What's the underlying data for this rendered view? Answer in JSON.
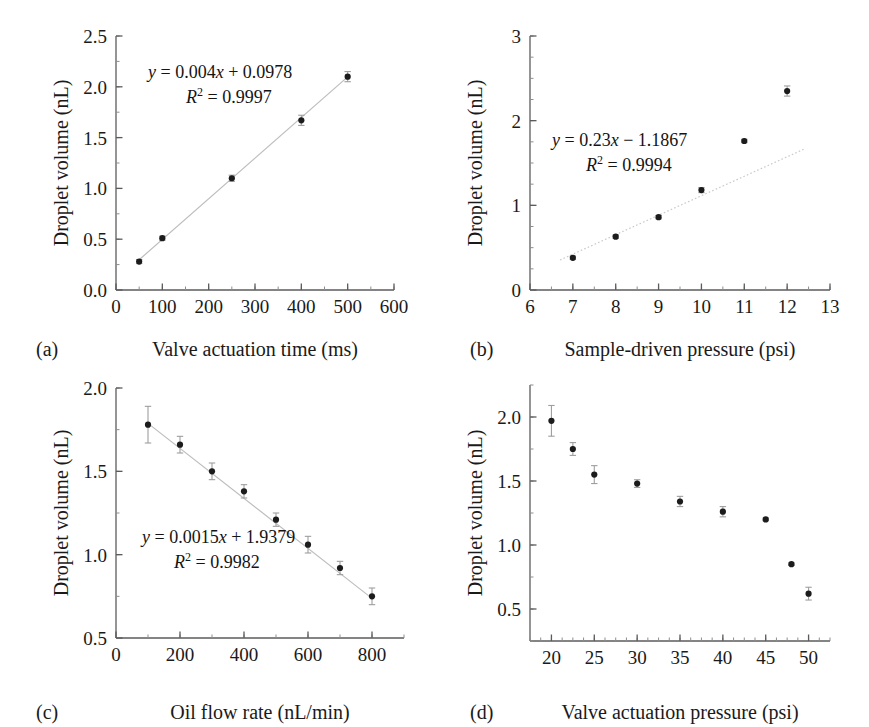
{
  "figure": {
    "caption_letters": [
      "(a)",
      "(b)",
      "(c)",
      "(d)"
    ],
    "shared_ylabel": "Droplet volume (nL)",
    "marker_color": "#1c1c1c",
    "trendline_color": "#bdbdbd",
    "axis_color": "#5b5b5b",
    "background": "#ffffff"
  },
  "chart_data": [
    {
      "id": "panel-a",
      "letter": "(a)",
      "type": "scatter",
      "title": "",
      "xlabel": "Valve actuation time (ms)",
      "ylabel": "Droplet volume (nL)",
      "xlim": [
        0,
        600
      ],
      "ylim": [
        0.0,
        2.5
      ],
      "xticks": [
        0,
        100,
        200,
        300,
        400,
        500,
        600
      ],
      "xticklabels": [
        "0",
        "100",
        "200",
        "300",
        "400",
        "500",
        "600"
      ],
      "yticks": [
        0.0,
        0.5,
        1.0,
        1.5,
        2.0,
        2.5
      ],
      "yticklabels": [
        "0.0",
        "0.5",
        "1.0",
        "1.5",
        "2.0",
        "2.5"
      ],
      "x_minor_step": 50,
      "y_minor_step": 0.25,
      "grid": false,
      "x": [
        50,
        100,
        250,
        400,
        500
      ],
      "values": [
        0.28,
        0.51,
        1.1,
        1.67,
        2.1
      ],
      "yerr": [
        0.02,
        0.02,
        0.03,
        0.05,
        0.05
      ],
      "trendline": {
        "style": "solid-light",
        "slope": 0.004,
        "intercept": 0.0978,
        "x_from": 50,
        "x_to": 500
      },
      "annotations": [
        {
          "line1_prefix": "y",
          "line1": " = 0.004x + 0.0978",
          "line2_prefix": "R",
          "line2_sup": "2",
          "line2": " = 0.9997"
        }
      ],
      "equation_text": "y = 0.004x + 0.0978",
      "r2_text": "R2 = 0.9997",
      "slope": 0.004,
      "intercept": 0.0978,
      "r_squared": 0.9997
    },
    {
      "id": "panel-b",
      "letter": "(b)",
      "type": "scatter",
      "title": "",
      "xlabel": "Sample-driven pressure (psi)",
      "ylabel": "Droplet volume (nL)",
      "xlim": [
        6,
        13
      ],
      "ylim": [
        0,
        3
      ],
      "xticks": [
        6,
        7,
        8,
        9,
        10,
        11,
        12,
        13
      ],
      "xticklabels": [
        "6",
        "7",
        "8",
        "9",
        "10",
        "11",
        "12",
        "13"
      ],
      "yticks": [
        0,
        1,
        2,
        3
      ],
      "yticklabels": [
        "0",
        "1",
        "2",
        "3"
      ],
      "x_minor_step": 0.5,
      "y_minor_step": 0.25,
      "grid": false,
      "x": [
        7,
        8,
        9,
        10,
        11,
        12
      ],
      "values": [
        0.38,
        0.63,
        0.86,
        1.18,
        1.76,
        2.35
      ],
      "yerr": [
        0.02,
        0.02,
        0.02,
        0.03,
        0.02,
        0.06
      ],
      "trendline": {
        "style": "dotted-light",
        "slope": 0.23,
        "intercept": -1.1867,
        "x_from": 6.7,
        "x_to": 12.4
      },
      "equation_text": "y = 0.23x − 1.1867",
      "r2_text": "R2 = 0.9994",
      "slope": 0.23,
      "intercept": -1.1867,
      "r_squared": 0.9994
    },
    {
      "id": "panel-c",
      "letter": "(c)",
      "type": "scatter",
      "title": "",
      "xlabel": "Oil flow rate (nL/min)",
      "ylabel": "Droplet volume (nL)",
      "xlim": [
        0,
        900
      ],
      "ylim": [
        0.5,
        2.0
      ],
      "xticks": [
        0,
        200,
        400,
        600,
        800
      ],
      "xticklabels": [
        "0",
        "200",
        "400",
        "600",
        "800"
      ],
      "yticks": [
        0.5,
        1.0,
        1.5,
        2.0
      ],
      "yticklabels": [
        "0.5",
        "1.0",
        "1.5",
        "2.0"
      ],
      "x_minor_step": 100,
      "y_minor_step": 0.25,
      "grid": false,
      "x": [
        100,
        200,
        300,
        400,
        500,
        600,
        700,
        800
      ],
      "values": [
        1.78,
        1.66,
        1.5,
        1.38,
        1.21,
        1.06,
        0.92,
        0.75
      ],
      "yerr": [
        0.11,
        0.05,
        0.05,
        0.04,
        0.04,
        0.05,
        0.04,
        0.05
      ],
      "trendline": {
        "style": "solid-light",
        "slope": -0.0015,
        "intercept": 1.9379,
        "x_from": 100,
        "x_to": 800
      },
      "equation_text": "y = 0.0015x + 1.9379",
      "r2_text": "R2 = 0.9982",
      "slope": -0.0015,
      "intercept": 1.9379,
      "r_squared": 0.9982
    },
    {
      "id": "panel-d",
      "letter": "(d)",
      "type": "scatter",
      "title": "",
      "xlabel": "Valve actuation pressure (psi)",
      "ylabel": "Droplet volume (nL)",
      "xlim": [
        17.5,
        52.5
      ],
      "ylim": [
        0.25,
        2.25
      ],
      "xticks": [
        20,
        25,
        30,
        35,
        40,
        45,
        50
      ],
      "xticklabels": [
        "20",
        "25",
        "30",
        "35",
        "40",
        "45",
        "50"
      ],
      "yticks": [
        0.5,
        1.0,
        1.5,
        2.0
      ],
      "yticklabels": [
        "0.5",
        "1.0",
        "1.5",
        "2.0"
      ],
      "x_minor_step": 1.25,
      "y_minor_step": 0.25,
      "grid": false,
      "x": [
        20,
        22.5,
        25,
        30,
        35,
        40,
        45,
        48,
        50
      ],
      "values": [
        1.97,
        1.75,
        1.55,
        1.48,
        1.34,
        1.26,
        1.2,
        0.85,
        0.62
      ],
      "yerr": [
        0.12,
        0.05,
        0.07,
        0.03,
        0.04,
        0.04,
        0.01,
        0.01,
        0.05
      ],
      "trendline": null,
      "equation_text": "",
      "r2_text": "",
      "r_squared": null
    }
  ]
}
